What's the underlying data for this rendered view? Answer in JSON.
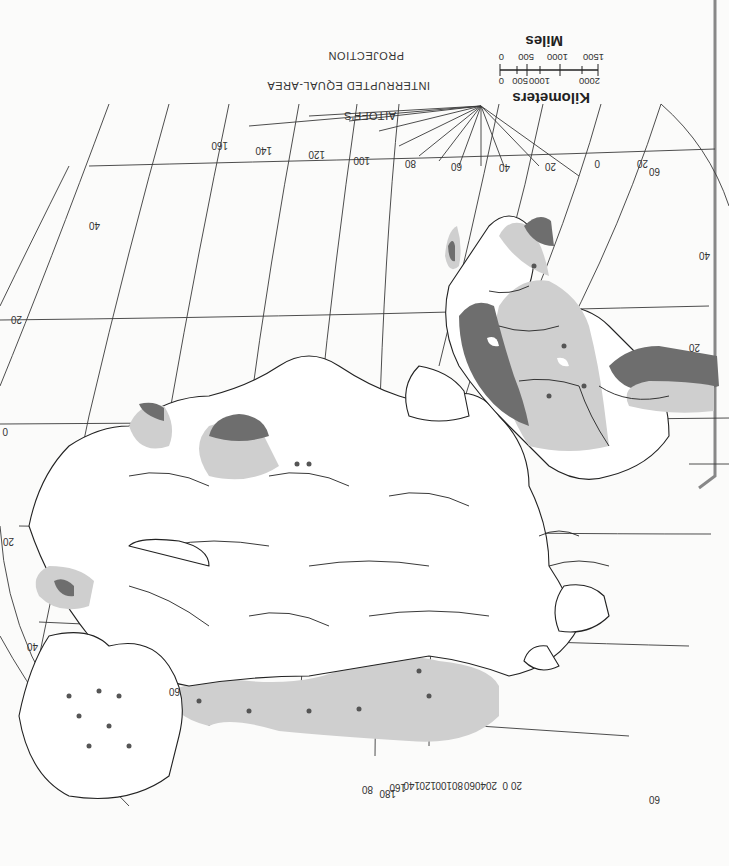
{
  "map": {
    "orientation": "rotated 180 degrees (upside-down)",
    "projection_title": [
      "AITOFF'S",
      "INTERRUPTED EQUAL-AREA",
      "PROJECTION"
    ],
    "scale": {
      "miles_title": "Miles",
      "miles_ticks": [
        "0",
        "500",
        "1000",
        "1500"
      ],
      "km_title": "Kilometers",
      "km_ticks": [
        "0",
        "500",
        "1000",
        "2000"
      ]
    },
    "graticule": {
      "meridian_labels_top": [
        "20",
        "0",
        "20",
        "40",
        "60",
        "80",
        "100",
        "120",
        "140",
        "160"
      ],
      "parallel_labels_right": [
        "60",
        "40",
        "20",
        "0",
        "20",
        "40",
        "60"
      ],
      "parallel_labels_left": [
        "40",
        "20",
        "0",
        "20",
        "40"
      ],
      "pole_fan_labels": [
        "80",
        "180",
        "160",
        "140",
        "120",
        "100",
        "80",
        "60",
        "40",
        "20",
        "0",
        "20"
      ],
      "corner_labels": [
        "60",
        "20",
        "40",
        "20",
        "60"
      ]
    },
    "shading": {
      "dark_gray": "#6e6e6e",
      "light_gray": "#cfcfcf",
      "land": "#ffffff",
      "background": "#fbfbfa"
    },
    "regions": [
      "Africa",
      "Europe",
      "Asia",
      "Australia",
      "Madagascar",
      "Arabia",
      "India",
      "Southeast Asia",
      "Northern Eurasia band"
    ]
  }
}
